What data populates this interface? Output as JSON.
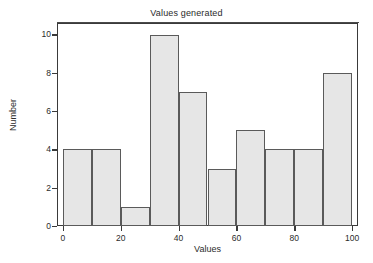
{
  "chart_data": {
    "type": "bar",
    "title": "Values generated",
    "xlabel": "Values",
    "ylabel": "Number",
    "categories": [
      "0-10",
      "10-20",
      "20-30",
      "30-40",
      "40-50",
      "50-60",
      "60-70",
      "70-80",
      "80-90",
      "90-100"
    ],
    "bin_edges": [
      0,
      10,
      20,
      30,
      40,
      50,
      60,
      70,
      80,
      90,
      100
    ],
    "values": [
      4,
      4,
      1,
      10,
      7,
      3,
      5,
      4,
      4,
      8
    ],
    "xlim": [
      -2,
      102
    ],
    "ylim": [
      0,
      10.6
    ],
    "xticks": [
      0,
      20,
      40,
      60,
      80,
      100
    ],
    "yticks": [
      0,
      2,
      4,
      6,
      8,
      10
    ],
    "xticklabels": [
      "0",
      "20",
      "40",
      "60",
      "80",
      "100"
    ],
    "yticklabels": [
      "0",
      "2",
      "4",
      "6",
      "8",
      "10"
    ],
    "grid": false,
    "legend": false,
    "bar_fill_color": "#e6e6e6",
    "bar_edge_color": "#5a5a5a",
    "axis_color": "#3a3a3a",
    "background_color": "#ffffff"
  }
}
